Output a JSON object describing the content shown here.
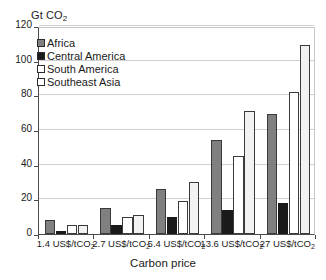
{
  "chart_data": {
    "type": "bar",
    "title": "",
    "ylabel": "Gt CO2",
    "ylabel_base": "Gt CO",
    "ylabel_sub": "2",
    "xlabel": "Carbon price",
    "ylim": [
      0,
      120
    ],
    "ytick_step": 20,
    "yticks": [
      0,
      20,
      40,
      60,
      80,
      100,
      120
    ],
    "grid": true,
    "legend_position": "top-left",
    "categories": [
      "1.4 US$/tCO2",
      "2.7 US$/tCO2",
      "5.4 US$/tCO2",
      "13.6 US$/tCO2",
      "27 US$/tCO2"
    ],
    "category_labels": [
      {
        "base": "1.4 US$/tCO",
        "sub": "2"
      },
      {
        "base": "2.7 US$/tCO",
        "sub": "2"
      },
      {
        "base": "5.4 US$/tCO",
        "sub": "2"
      },
      {
        "base": "13.6 US$/tCO",
        "sub": "2"
      },
      {
        "base": "27 US$/tCO",
        "sub": "2"
      }
    ],
    "series": [
      {
        "name": "Africa",
        "color": "#808080",
        "border": "#3a3a3a",
        "values": [
          8,
          15,
          26,
          54,
          69
        ]
      },
      {
        "name": "Central America",
        "color": "#1a1a1a",
        "border": "#1a1a1a",
        "values": [
          2,
          5,
          10,
          14,
          18
        ]
      },
      {
        "name": "South America",
        "color": "#ffffff",
        "border": "#3a3a3a",
        "values": [
          5,
          10,
          19,
          45,
          82
        ]
      },
      {
        "name": "Southeast Asia",
        "color": "#f2f2f2",
        "border": "#3a3a3a",
        "values": [
          5,
          11,
          30,
          71,
          109
        ]
      }
    ]
  },
  "legend": {
    "items": [
      {
        "label": "Africa",
        "color": "#808080"
      },
      {
        "label": "Central America",
        "color": "#1a1a1a"
      },
      {
        "label": "South America",
        "color": "#ffffff"
      },
      {
        "label": "Southeast Asia",
        "color": "#ffffff"
      }
    ]
  }
}
